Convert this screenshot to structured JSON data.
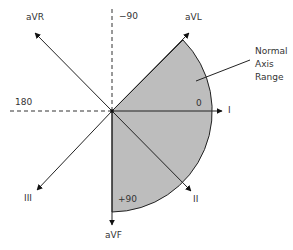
{
  "diagram": {
    "center": [
      112,
      111
    ],
    "colors": {
      "sector_fill": "#bdbdbd",
      "line": "#222222",
      "text": "#333333"
    },
    "leads": [
      {
        "name": "I",
        "angle_deg": 0
      },
      {
        "name": "II",
        "angle_deg": 60
      },
      {
        "name": "aVF",
        "angle_deg": 90
      },
      {
        "name": "III",
        "angle_deg": 120
      },
      {
        "name": "aVR",
        "angle_deg": -150
      },
      {
        "name": "aVL",
        "angle_deg": -30
      }
    ],
    "reference_axes": [
      {
        "label": "-90",
        "direction": "up",
        "style": "dashed"
      },
      {
        "label": "180",
        "direction": "left",
        "style": "dashed"
      }
    ],
    "degree_labels": {
      "zero": "0",
      "plus90": "+90",
      "minus90": "−90",
      "one_eighty": "180"
    },
    "normal_range": {
      "label_lines": [
        "Normal",
        "Axis",
        "Range"
      ],
      "from_deg": -30,
      "to_deg": 90
    }
  },
  "labels": {
    "aVR": "aVR",
    "aVL": "aVL",
    "I": "I",
    "II": "II",
    "III": "III",
    "aVF": "aVF",
    "minus90": "−90",
    "one_eighty": "180",
    "zero": "0",
    "plus90": "+90",
    "normal1": "Normal",
    "normal2": "Axis",
    "normal3": "Range"
  }
}
